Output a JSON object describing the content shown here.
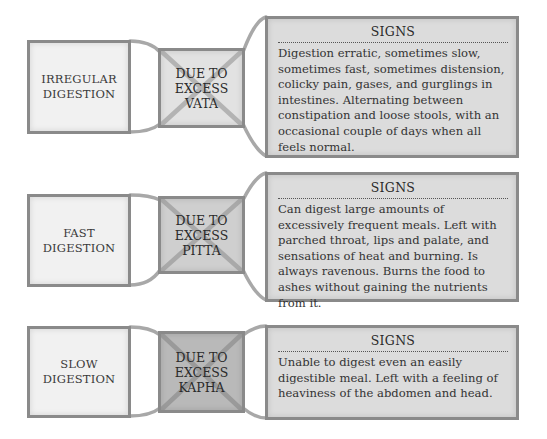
{
  "colors": {
    "left_fill": "#f1f1f1",
    "border": "#8a8a8a",
    "vata_fill": "#e2e2e2",
    "pitta_fill": "#cfcfcf",
    "kapha_fill": "#b9b9b9",
    "signs_fill": "#dcdcdc"
  },
  "rows": [
    {
      "condition": "IRREGULAR DIGESTION",
      "cause_lines": [
        "DUE TO",
        "EXCESS",
        "VATA"
      ],
      "signs_title": "SIGNS",
      "signs_text": "Digestion erratic, sometimes slow, sometimes fast, sometimes distension, colicky pain, gases, and gurglings in intestines. Alternating between constipation and loose stools, with an occasional couple of days when all feels normal."
    },
    {
      "condition": "FAST DIGESTION",
      "cause_lines": [
        "DUE TO",
        "EXCESS",
        "PITTA"
      ],
      "signs_title": "SIGNS",
      "signs_text": "Can digest large amounts of excessively frequent meals. Left with parched throat, lips and palate, and sensations of heat and burning. Is always ravenous. Burns the food to ashes without gaining the nutrients from it."
    },
    {
      "condition": "SLOW DIGESTION",
      "cause_lines": [
        "DUE TO",
        "EXCESS",
        "KAPHA"
      ],
      "signs_title": "SIGNS",
      "signs_text": "Unable to digest even an easily digestible meal. Left with a feeling of heaviness of the abdomen and head."
    }
  ]
}
